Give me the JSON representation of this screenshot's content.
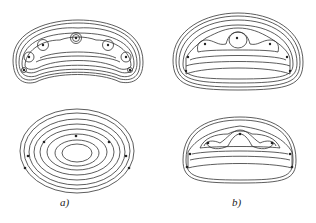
{
  "figure": {
    "panels": [
      {
        "id": "a-top",
        "label": "",
        "description": "contour plot, 7 electrodes"
      },
      {
        "id": "b-top",
        "label": "",
        "description": "contour plot, 7 electrodes"
      },
      {
        "id": "a-bottom",
        "label": "a)",
        "description": "concentric contour plot, 7 electrodes"
      },
      {
        "id": "b-bottom",
        "label": "b)",
        "description": "contour plot, 7 electrodes"
      }
    ],
    "labels": {
      "a": "a)",
      "b": "b)"
    },
    "colors": {
      "line": "#333333",
      "background": "#ffffff"
    }
  }
}
